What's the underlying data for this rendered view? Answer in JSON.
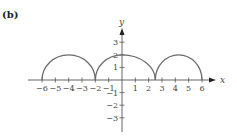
{
  "panel_label": "(b)",
  "chart_data": {
    "type": "line",
    "title": "",
    "xlabel": "x",
    "ylabel": "y",
    "xlim": [
      -6.5,
      6.5
    ],
    "ylim": [
      -3.5,
      3.5
    ],
    "grid": false,
    "x_ticks": [
      -6,
      -5,
      -4,
      -3,
      -2,
      -1,
      1,
      2,
      3,
      4,
      5,
      6
    ],
    "x_tick_labels": [
      "−6",
      "−5",
      "−4",
      "−3",
      "−2",
      "−1",
      "1",
      "2",
      "3",
      "4",
      "5",
      "6"
    ],
    "y_ticks": [
      3,
      2,
      1,
      -1,
      -2,
      -3
    ],
    "y_tick_labels": [
      "3",
      "2",
      "1",
      "−1",
      "−2",
      "−3"
    ],
    "series": [
      {
        "name": "f(x)",
        "description": "Three arched (semi-elliptical) pieces, each reaching a maximum of 2",
        "pieces": [
          {
            "x_start": -6,
            "x_peak": -4,
            "x_end": -2,
            "peak_y": 2
          },
          {
            "x_start": -2,
            "x_peak": 0,
            "x_end": 2.5,
            "peak_y": 2
          },
          {
            "x_start": 2.5,
            "x_peak": 4.25,
            "x_end": 6,
            "peak_y": 2
          }
        ],
        "points": [
          [
            -6,
            0
          ],
          [
            -4,
            2
          ],
          [
            -2,
            0
          ],
          [
            0,
            2
          ],
          [
            2.5,
            0
          ],
          [
            4.25,
            2
          ],
          [
            6,
            0
          ]
        ],
        "color": "#6b6b6b"
      }
    ]
  },
  "colors": {
    "axis": "#555555",
    "curve": "#6b6b6b",
    "text": "#444444"
  }
}
